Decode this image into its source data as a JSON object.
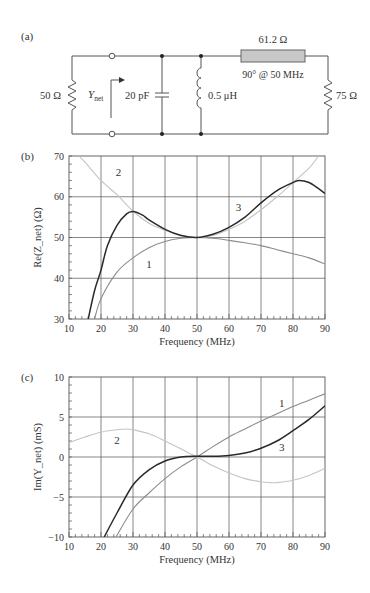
{
  "figure": {
    "panel_a_label": "(a)",
    "panel_b_label": "(b)",
    "panel_c_label": "(c)"
  },
  "circuit": {
    "source_resistor": "50 Ω",
    "port_label_main": "Y",
    "port_label_sub": "net",
    "capacitor": "20 pF",
    "inductor": "0.5 μH",
    "line_impedance": "61.2 Ω",
    "line_length": "90° @ 50 MHz",
    "load_resistor": "75 Ω"
  },
  "colors": {
    "curve1": "#8c8c8c",
    "curve2": "#c4c4c4",
    "curve3": "#2a2a2a",
    "grid": "#555555",
    "tline_fill": "#c8c8c8"
  },
  "chart_data": [
    {
      "type": "line",
      "title": "",
      "xlabel": "Frequency (MHz)",
      "ylabel": "Re(Z_net) (Ω)",
      "xlim": [
        10,
        90
      ],
      "ylim": [
        30,
        70
      ],
      "xticks": [
        10,
        20,
        30,
        40,
        50,
        60,
        70,
        80,
        90
      ],
      "yticks": [
        30,
        40,
        50,
        60,
        70
      ],
      "grid": true,
      "annotations": [
        {
          "text": "2",
          "x": 25.5,
          "y": 66
        },
        {
          "text": "3",
          "x": 63,
          "y": 57.5
        },
        {
          "text": "1",
          "x": 35,
          "y": 43.5
        }
      ],
      "series": [
        {
          "name": "1",
          "x": [
            18,
            20,
            25,
            30,
            35,
            40,
            45,
            50,
            55,
            60,
            65,
            70,
            75,
            80,
            85,
            90
          ],
          "y": [
            30,
            35,
            41.5,
            45,
            47.5,
            49,
            49.8,
            50,
            49.8,
            49.3,
            48.7,
            48,
            47,
            46,
            45,
            43.5
          ]
        },
        {
          "name": "2",
          "x": [
            13,
            15,
            20,
            25,
            30,
            35,
            40,
            45,
            50,
            55,
            60,
            65,
            70,
            75,
            80,
            85,
            88
          ],
          "y": [
            70,
            68.5,
            64,
            60.5,
            56.5,
            53.5,
            51.8,
            50.6,
            50,
            50.5,
            52,
            54,
            56.8,
            60,
            63.5,
            67,
            70
          ]
        },
        {
          "name": "3",
          "x": [
            16,
            18,
            20,
            22,
            25,
            28,
            30,
            33,
            35,
            40,
            45,
            50,
            55,
            60,
            65,
            70,
            75,
            80,
            82,
            85,
            88,
            90
          ],
          "y": [
            30,
            37,
            42,
            48,
            53,
            55.8,
            56.4,
            55.5,
            54.3,
            52,
            50.5,
            50,
            50.8,
            52.5,
            55,
            58.5,
            61.5,
            63.5,
            64,
            63.5,
            62,
            60.8
          ]
        }
      ]
    },
    {
      "type": "line",
      "title": "",
      "xlabel": "Frequency (MHz)",
      "ylabel": "Im(Y_net) (mS)",
      "xlim": [
        10,
        90
      ],
      "ylim": [
        -10,
        10
      ],
      "xticks": [
        10,
        20,
        30,
        40,
        50,
        60,
        70,
        80,
        90
      ],
      "yticks": [
        -10,
        -5,
        0,
        5,
        10
      ],
      "ytick_labels": [
        "−10",
        "−5",
        "0",
        "5",
        "10"
      ],
      "grid": true,
      "annotations": [
        {
          "text": "1",
          "x": 76.5,
          "y": 6.7
        },
        {
          "text": "2",
          "x": 25,
          "y": 2.1
        },
        {
          "text": "3",
          "x": 76.5,
          "y": 1.2
        }
      ],
      "series": [
        {
          "name": "1",
          "x": [
            24.7,
            30,
            35,
            40,
            45,
            50,
            55,
            60,
            65,
            70,
            75,
            80,
            85,
            90
          ],
          "y": [
            -10,
            -6.5,
            -4.5,
            -2.7,
            -1.2,
            0,
            1.3,
            2.5,
            3.5,
            4.5,
            5.4,
            6.3,
            7.1,
            7.9
          ]
        },
        {
          "name": "2",
          "x": [
            10,
            15,
            20,
            25,
            28,
            30,
            35,
            40,
            45,
            50,
            55,
            60,
            65,
            70,
            73,
            75,
            80,
            85,
            90
          ],
          "y": [
            1.8,
            2.5,
            3.1,
            3.4,
            3.5,
            3.4,
            2.9,
            2.0,
            1.0,
            0,
            -1.1,
            -2.0,
            -2.7,
            -3.1,
            -3.2,
            -3.2,
            -2.9,
            -2.3,
            -1.4
          ]
        },
        {
          "name": "3",
          "x": [
            21,
            25,
            30,
            35,
            40,
            45,
            50,
            55,
            60,
            65,
            70,
            75,
            80,
            85,
            90
          ],
          "y": [
            -10,
            -7,
            -3.5,
            -1.6,
            -0.5,
            0,
            0.1,
            0.1,
            0.2,
            0.5,
            1.1,
            2.0,
            3.3,
            4.7,
            6.4
          ]
        }
      ]
    }
  ]
}
